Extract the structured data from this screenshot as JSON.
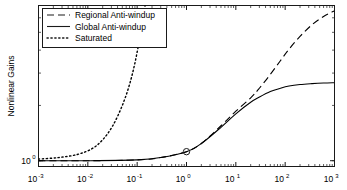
{
  "chart_data": {
    "type": "line",
    "title": "",
    "xlabel": "",
    "ylabel": "Nonlinear Gains",
    "xscale": "log",
    "yscale": "log",
    "xlim": [
      0.001,
      1000
    ],
    "ylim": [
      0.93,
      7.0
    ],
    "grid": false,
    "legend_position": "upper left",
    "xticks": [
      "10-3",
      "10-2",
      "10-1",
      "10 0",
      "10 1",
      "10 2",
      "10 3"
    ],
    "xtick_mantissa": "10",
    "xtick_exponents": [
      "-3",
      "-2",
      "-1",
      "0",
      "1",
      "2",
      "3"
    ],
    "ytick_mantissa": "10",
    "ytick_exponents": [
      "0"
    ],
    "yticks": [
      "10 0"
    ],
    "markers": [
      {
        "name": "operating-point",
        "x": 1.0,
        "y": 1.12,
        "shape": "circle",
        "series": "Global Anti-windup"
      }
    ],
    "series": [
      {
        "name": "Regional Anti-windup",
        "style": "dashed",
        "color": "#000000",
        "x": [
          0.001,
          0.01,
          0.1,
          0.3,
          1.0,
          2.0,
          5.0,
          10.0,
          20.0,
          30.0,
          50.0,
          80.0,
          120.0,
          200.0,
          350.0,
          600.0,
          1000.0
        ],
        "y": [
          1.0,
          1.0,
          1.01,
          1.04,
          1.12,
          1.24,
          1.55,
          1.86,
          2.2,
          2.48,
          2.95,
          3.5,
          4.05,
          4.75,
          5.5,
          6.1,
          6.55
        ]
      },
      {
        "name": "Global Anti-windup",
        "style": "solid",
        "color": "#000000",
        "x": [
          0.001,
          0.01,
          0.1,
          0.3,
          1.0,
          2.0,
          5.0,
          10.0,
          20.0,
          30.0,
          50.0,
          80.0,
          120.0,
          200.0,
          350.0,
          600.0,
          1000.0
        ],
        "y": [
          1.0,
          1.0,
          1.01,
          1.04,
          1.12,
          1.24,
          1.52,
          1.8,
          2.08,
          2.22,
          2.38,
          2.48,
          2.55,
          2.6,
          2.63,
          2.65,
          2.66
        ]
      },
      {
        "name": "Saturated",
        "style": "dotted",
        "color": "#000000",
        "x": [
          0.001,
          0.0025,
          0.006,
          0.012,
          0.02,
          0.032,
          0.05,
          0.07,
          0.09,
          0.11,
          0.13,
          0.145
        ],
        "y": [
          1.02,
          1.04,
          1.08,
          1.16,
          1.3,
          1.55,
          2.0,
          2.6,
          3.4,
          4.5,
          5.9,
          7.0
        ]
      }
    ]
  },
  "legend": {
    "entries": [
      {
        "label": "Regional Anti-windup",
        "style": "dashed"
      },
      {
        "label": "Global Anti-windup",
        "style": "solid"
      },
      {
        "label": "Saturated",
        "style": "dotted"
      }
    ]
  },
  "axes": {
    "ylabel": "Nonlinear Gains"
  }
}
